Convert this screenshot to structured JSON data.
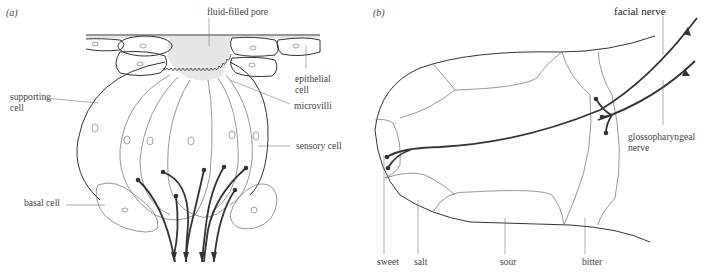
{
  "panel_a": {
    "label": "(a)",
    "labels": {
      "pore": "fluid-filled pore",
      "epithelial_1": "epithelial",
      "epithelial_2": "cell",
      "supporting_1": "supporting",
      "supporting_2": "cell",
      "microvilli": "microvilli",
      "sensory": "sensory cell",
      "basal": "basal cell"
    }
  },
  "panel_b": {
    "label": "(b)",
    "labels": {
      "facial": "facial nerve",
      "glosso_1": "glossopharyngeal",
      "glosso_2": "nerve",
      "sweet": "sweet",
      "salt": "salt",
      "sour": "sour",
      "bitter": "bitter"
    }
  },
  "colors": {
    "ink": "#333333",
    "pore_fill": "#e6e6e6",
    "background": "#ffffff"
  }
}
